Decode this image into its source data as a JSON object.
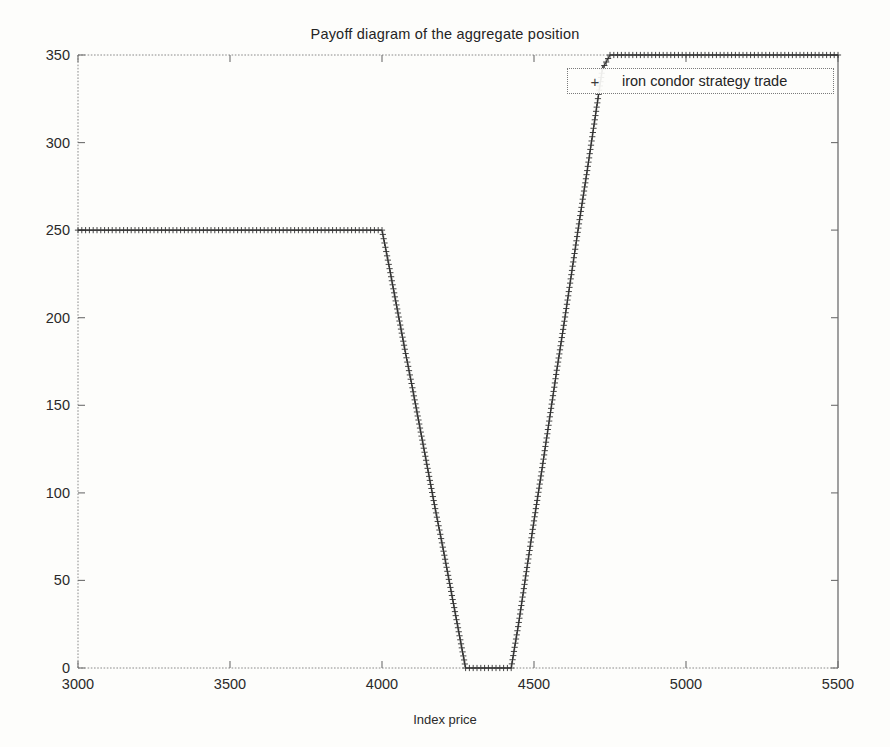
{
  "chart_data": {
    "type": "line",
    "title": "Payoff diagram of the aggregate position",
    "xlabel": "Index price",
    "ylabel": "Payoff",
    "xlim": [
      3000,
      5500
    ],
    "ylim": [
      0,
      350
    ],
    "xticks": [
      3000,
      3500,
      4000,
      4500,
      5000,
      5500
    ],
    "yticks": [
      0,
      50,
      100,
      150,
      200,
      250,
      300,
      350
    ],
    "grid": false,
    "legend_position": "top-right",
    "marker": "+",
    "marker_symbol": "plus-marker",
    "line_color": "#2f2f2f",
    "series": [
      {
        "name": "iron condor strategy trade",
        "x": [
          3000,
          3050,
          3100,
          3150,
          3200,
          3250,
          3300,
          3350,
          3400,
          3450,
          3500,
          3550,
          3600,
          3650,
          3700,
          3750,
          3800,
          3850,
          3900,
          3950,
          4000,
          4025,
          4050,
          4075,
          4100,
          4125,
          4150,
          4175,
          4200,
          4225,
          4250,
          4275,
          4300,
          4325,
          4350,
          4375,
          4400,
          4425,
          4450,
          4475,
          4500,
          4525,
          4550,
          4575,
          4600,
          4625,
          4650,
          4675,
          4700,
          4725,
          4750,
          4775,
          4800,
          4850,
          4900,
          4950,
          5000,
          5050,
          5100,
          5150,
          5200,
          5250,
          5300,
          5350,
          5400,
          5450,
          5500
        ],
        "y": [
          250,
          250,
          250,
          250,
          250,
          250,
          250,
          250,
          250,
          250,
          250,
          250,
          250,
          250,
          250,
          250,
          250,
          250,
          250,
          250,
          250,
          228,
          205,
          182,
          160,
          137,
          114,
          91,
          69,
          46,
          23,
          0,
          0,
          0,
          0,
          0,
          0,
          0,
          26,
          55,
          84,
          112,
          141,
          170,
          198,
          227,
          256,
          284,
          313,
          342,
          350,
          350,
          350,
          350,
          350,
          350,
          350,
          350,
          350,
          350,
          350,
          350,
          350,
          350,
          350,
          350,
          350
        ]
      }
    ],
    "breakpoints": {
      "upper_plateau_payoff": 250,
      "upper_plateau_end_price": 4000,
      "trough_payoff": 0,
      "trough_start_price": 4275,
      "trough_end_price": 4425,
      "clip_top_payoff": 350,
      "clip_top_start_price": 4750
    }
  },
  "legend": {
    "marker": "+",
    "label": "iron condor strategy trade"
  },
  "axes": {
    "x_tick_labels": [
      "3000",
      "3500",
      "4000",
      "4500",
      "5000",
      "5500"
    ],
    "y_tick_labels": [
      "0",
      "50",
      "100",
      "150",
      "200",
      "250",
      "300",
      "350"
    ],
    "xlabel": "Index price",
    "ylabel": "Payoff"
  },
  "colors": {
    "background": "#fdfdfb",
    "axis": "#6e6e6e",
    "line": "#2f2f2f",
    "text": "#242424"
  }
}
